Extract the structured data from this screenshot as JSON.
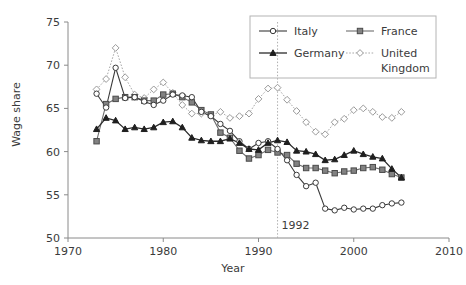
{
  "chart_data": {
    "type": "line",
    "title": "",
    "xlabel": "Year",
    "ylabel": "Wage share",
    "xlim": [
      1970,
      2010
    ],
    "ylim": [
      50,
      75
    ],
    "xticks": [
      1970,
      1980,
      1990,
      2000,
      2010
    ],
    "yticks": [
      50,
      55,
      60,
      65,
      70,
      75
    ],
    "grid": false,
    "legend_position": "top-right",
    "annotations": [
      {
        "type": "vline",
        "x": 1992,
        "label": "1992",
        "style": "dotted"
      }
    ],
    "x": [
      1973,
      1974,
      1975,
      1976,
      1977,
      1978,
      1979,
      1980,
      1981,
      1982,
      1983,
      1984,
      1985,
      1986,
      1987,
      1988,
      1989,
      1990,
      1991,
      1992,
      1993,
      1994,
      1995,
      1996,
      1997,
      1998,
      1999,
      2000,
      2001,
      2002,
      2003,
      2004,
      2005
    ],
    "series": [
      {
        "name": "Italy",
        "marker": "open-circle",
        "line": "solid",
        "color": "#3a3a3a",
        "values": [
          66.7,
          65.1,
          69.7,
          66.2,
          66.3,
          65.8,
          65.4,
          65.9,
          66.6,
          66.5,
          66.3,
          64.6,
          64.1,
          63.2,
          62.4,
          61.2,
          60.3,
          61.0,
          61.2,
          60.3,
          59.0,
          57.3,
          56.0,
          56.4,
          53.4,
          53.2,
          53.5,
          53.3,
          53.4,
          53.4,
          53.8,
          54.0,
          54.1
        ]
      },
      {
        "name": "France",
        "marker": "filled-square",
        "line": "solid",
        "color": "#828282",
        "values": [
          61.2,
          65.5,
          66.1,
          66.3,
          66.3,
          65.9,
          65.9,
          66.6,
          66.7,
          66.3,
          65.7,
          64.8,
          64.3,
          62.2,
          61.6,
          60.1,
          59.2,
          59.6,
          60.2,
          59.9,
          59.6,
          58.6,
          58.1,
          58.1,
          57.8,
          57.5,
          57.7,
          57.8,
          58.1,
          58.2,
          57.9,
          57.4,
          57.0
        ]
      },
      {
        "name": "Germany",
        "marker": "filled-triangle",
        "line": "solid",
        "color": "#1f1f1f",
        "values": [
          62.6,
          63.9,
          63.6,
          62.6,
          62.8,
          62.6,
          62.8,
          63.4,
          63.5,
          62.8,
          61.6,
          61.3,
          61.2,
          61.2,
          61.5,
          61.0,
          60.3,
          60.2,
          61.0,
          61.3,
          61.1,
          60.1,
          60.0,
          59.7,
          59.0,
          59.1,
          59.6,
          60.1,
          59.7,
          59.4,
          59.2,
          58.0,
          57.0
        ]
      },
      {
        "name": "United Kingdom",
        "marker": "open-diamond",
        "line": "dotted",
        "color": "#a8a8a8",
        "values": [
          67.2,
          68.4,
          72.0,
          68.6,
          66.6,
          66.2,
          67.2,
          68.0,
          66.8,
          65.4,
          64.4,
          64.4,
          64.2,
          64.6,
          63.9,
          64.1,
          64.4,
          66.1,
          67.3,
          67.4,
          66.0,
          64.7,
          63.4,
          62.3,
          62.0,
          63.4,
          63.8,
          64.8,
          65.0,
          64.6,
          64.0,
          63.9,
          64.6
        ]
      }
    ]
  },
  "legend": {
    "entries": [
      {
        "label": "Italy"
      },
      {
        "label": "France"
      },
      {
        "label": "Germany"
      },
      {
        "label": "United"
      },
      {
        "label": "Kingdom"
      }
    ]
  },
  "axes": {
    "x_tick_labels": [
      "1970",
      "1980",
      "1990",
      "2000",
      "2010"
    ],
    "y_tick_labels": [
      "50",
      "55",
      "60",
      "65",
      "70",
      "75"
    ],
    "x_title": "Year",
    "y_title": "Wage share"
  },
  "annotation": {
    "year_marker": "1992"
  }
}
